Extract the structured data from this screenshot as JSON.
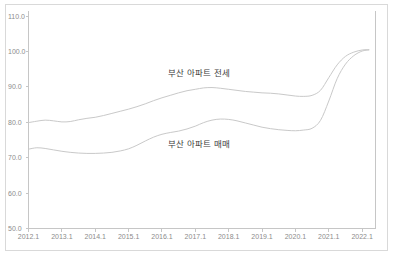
{
  "chart_data": {
    "type": "line",
    "title": "",
    "subtitle": "",
    "xlabel": "",
    "ylabel": "",
    "grid": false,
    "legend_position": "inline-annotation",
    "ylim": [
      50.0,
      110.0
    ],
    "ytick_labels": [
      "110.0",
      "100.0",
      "90.0",
      "80.0",
      "70.0",
      "60.0",
      "50.0"
    ],
    "ytick_values": [
      110.0,
      100.0,
      90.0,
      80.0,
      70.0,
      60.0,
      50.0
    ],
    "xtick_labels": [
      "2012.1",
      "2013.1",
      "2014.1",
      "2015.1",
      "2016.1",
      "2017.1",
      "2018.1",
      "2019.1",
      "2020.1",
      "2021.1",
      "2022.1"
    ],
    "xtick_values": [
      2012.0,
      2013.0,
      2014.0,
      2015.0,
      2016.0,
      2017.0,
      2018.0,
      2019.0,
      2020.0,
      2021.0,
      2022.0
    ],
    "xlim": [
      2012.0,
      2022.4
    ],
    "series": [
      {
        "name": "부산 아파트 전세",
        "color": "#c9c9c9",
        "x": [
          2012.0,
          2012.25,
          2012.5,
          2012.75,
          2013.0,
          2013.25,
          2013.5,
          2013.75,
          2014.0,
          2014.25,
          2014.5,
          2014.75,
          2015.0,
          2015.25,
          2015.5,
          2015.75,
          2016.0,
          2016.25,
          2016.5,
          2016.75,
          2017.0,
          2017.25,
          2017.5,
          2017.75,
          2018.0,
          2018.25,
          2018.5,
          2018.75,
          2019.0,
          2019.25,
          2019.5,
          2019.75,
          2020.0,
          2020.25,
          2020.5,
          2020.75,
          2021.0,
          2021.25,
          2021.5,
          2021.75,
          2022.0,
          2022.2
        ],
        "values": [
          79.9,
          80.3,
          80.6,
          80.4,
          80.1,
          80.2,
          80.7,
          81.1,
          81.4,
          81.9,
          82.5,
          83.1,
          83.7,
          84.4,
          85.2,
          86.1,
          86.9,
          87.6,
          88.3,
          88.9,
          89.3,
          89.7,
          89.8,
          89.6,
          89.3,
          89.0,
          88.7,
          88.5,
          88.3,
          88.2,
          88.0,
          87.7,
          87.4,
          87.3,
          87.6,
          89.0,
          92.6,
          96.2,
          98.6,
          99.8,
          100.4,
          100.5
        ]
      },
      {
        "name": "부산 아파트 매매",
        "color": "#c9c9c9",
        "x": [
          2012.0,
          2012.25,
          2012.5,
          2012.75,
          2013.0,
          2013.25,
          2013.5,
          2013.75,
          2014.0,
          2014.25,
          2014.5,
          2014.75,
          2015.0,
          2015.25,
          2015.5,
          2015.75,
          2016.0,
          2016.25,
          2016.5,
          2016.75,
          2017.0,
          2017.25,
          2017.5,
          2017.75,
          2018.0,
          2018.25,
          2018.5,
          2018.75,
          2019.0,
          2019.25,
          2019.5,
          2019.75,
          2020.0,
          2020.25,
          2020.5,
          2020.75,
          2021.0,
          2021.25,
          2021.5,
          2021.75,
          2022.0,
          2022.2
        ],
        "values": [
          72.4,
          72.8,
          72.6,
          72.2,
          71.8,
          71.5,
          71.3,
          71.2,
          71.2,
          71.3,
          71.5,
          71.9,
          72.5,
          73.5,
          74.7,
          75.8,
          76.6,
          77.1,
          77.5,
          78.1,
          78.9,
          79.9,
          80.6,
          80.9,
          80.8,
          80.4,
          79.8,
          79.2,
          78.6,
          78.2,
          77.9,
          77.7,
          77.6,
          77.8,
          78.3,
          80.5,
          86.0,
          92.3,
          96.4,
          98.8,
          100.1,
          100.4
        ]
      }
    ],
    "annotations": [
      {
        "text": "부산 아파트 전세",
        "series": "부산 아파트 전세"
      },
      {
        "text": "부산 아파트 매매",
        "series": "부산 아파트 매매"
      }
    ],
    "colors": {
      "line": "#c9c9c9",
      "axis": "#c6c6c6",
      "border": "#d9d9d9",
      "tick_label": "#8c8c8c",
      "annotation_text": "#3d3d3d",
      "background": "#ffffff"
    }
  }
}
